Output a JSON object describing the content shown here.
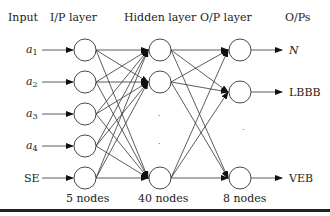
{
  "diagram": {
    "type": "neural-network",
    "headers": {
      "input": "Input",
      "ip_layer": "I/P layer",
      "hidden_layer": "Hidden layer",
      "op_layer": "O/P layer",
      "ops": "O/Ps"
    },
    "inputs": [
      {
        "label": "a",
        "sub": "1"
      },
      {
        "label": "a",
        "sub": "2"
      },
      {
        "label": "a",
        "sub": "3"
      },
      {
        "label": "a",
        "sub": "4"
      },
      {
        "label": "SE",
        "sub": ""
      }
    ],
    "outputs": [
      "N",
      "LBBB",
      "VEB"
    ],
    "node_counts": {
      "ip": "5 nodes",
      "hidden": "40 nodes",
      "op": "8 nodes"
    },
    "ellipsis": "·"
  }
}
